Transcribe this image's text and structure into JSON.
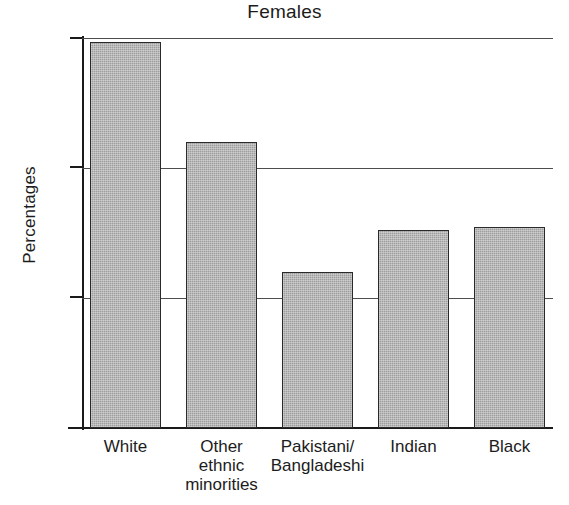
{
  "chart_data": {
    "type": "bar",
    "title": "Females",
    "xlabel": "",
    "ylabel": "Percentages",
    "categories": [
      "White",
      "Other\nethnic\nminorities",
      "Pakistani/\nBangladeshi",
      "Indian",
      "Black"
    ],
    "values": [
      59.4,
      44.0,
      24.0,
      30.5,
      31.0
    ],
    "ylim": [
      0,
      60
    ],
    "yticks": [
      0,
      20,
      40,
      60
    ],
    "ytick_labels": [
      "0",
      "20",
      "40",
      "60"
    ],
    "grid": "horizontal",
    "legend": "none",
    "bar_fill_color": "#9d9d9d",
    "bar_border_color": "#2a2a2a",
    "axis_color": "#1a1a1a",
    "gridline_color": "#4d4d4d",
    "background_color": "#ffffff"
  },
  "axis": {
    "y_label": "Percentages",
    "tick_0": "0",
    "tick_20": "20",
    "tick_40": "40",
    "tick_60": "60"
  },
  "bars": [
    {
      "label": "White",
      "value": 59.4
    },
    {
      "label": "Other\nethnic\nminorities",
      "value": 44.0
    },
    {
      "label": "Pakistani/\nBangladeshi",
      "value": 24.0
    },
    {
      "label": "Indian",
      "value": 30.5
    },
    {
      "label": "Black",
      "value": 31.0
    }
  ],
  "footer": {
    "clipped_text": "                                                                    "
  }
}
